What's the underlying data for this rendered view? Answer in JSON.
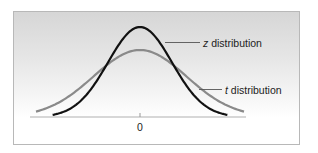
{
  "chart_data": {
    "type": "line",
    "title": "",
    "xlabel": "",
    "ylabel": "",
    "x_ticks": [
      0
    ],
    "x_tick_labels": [
      "0"
    ],
    "xlim": [
      -3.4,
      3.4
    ],
    "grid": false,
    "legend_position": "inline annotations (right)",
    "annotations": [
      {
        "series": "z distribution",
        "italic_prefix": "z",
        "text": " distribution"
      },
      {
        "series": "t distribution",
        "italic_prefix": "t",
        "text": " distribution"
      }
    ],
    "series": [
      {
        "name": "z distribution",
        "color": "#111111",
        "x_range": [
          -2.73,
          2.73
        ],
        "peak_density": 0.399,
        "description": "standard normal curve, taller and narrower"
      },
      {
        "name": "t distribution",
        "color": "#8a8a8a",
        "x_range": [
          -3.25,
          3.25
        ],
        "peak_density": 0.297,
        "description": "lower peak, heavier tails"
      }
    ]
  },
  "labels": {
    "zero": "0",
    "z_italic": "z",
    "z_rest": " distribution",
    "t_italic": "t",
    "t_rest": " distribution"
  },
  "colors": {
    "z_curve": "#111111",
    "t_curve": "#8a8a8a",
    "axis": "#b0b0b0",
    "frame_border": "#b8b8b8",
    "leader": "#555555"
  }
}
